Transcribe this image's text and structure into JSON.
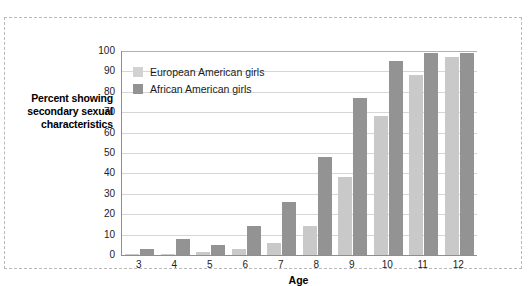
{
  "chart_data": {
    "type": "bar",
    "title": "",
    "xlabel": "Age",
    "ylabel": "Percent showing secondary sexual characteristics",
    "categories": [
      "3",
      "4",
      "5",
      "6",
      "7",
      "8",
      "9",
      "10",
      "11",
      "12"
    ],
    "series": [
      {
        "name": "European American girls",
        "color": "#c9c9c9",
        "values": [
          0.5,
          0.5,
          1.5,
          3,
          6,
          14,
          38,
          68,
          88,
          97
        ]
      },
      {
        "name": "African American girls",
        "color": "#939393",
        "values": [
          3,
          8,
          5,
          14,
          26,
          48,
          77,
          95,
          99,
          99
        ]
      }
    ],
    "ylim": [
      0,
      100
    ],
    "yticks": [
      "0",
      "10",
      "20",
      "30",
      "40",
      "50",
      "60",
      "70",
      "80",
      "90",
      "100"
    ],
    "grid": true,
    "legend_position": "upper-left-inside"
  },
  "figure": {
    "border_style": "dashed",
    "border_color": "#b9b9b9"
  }
}
